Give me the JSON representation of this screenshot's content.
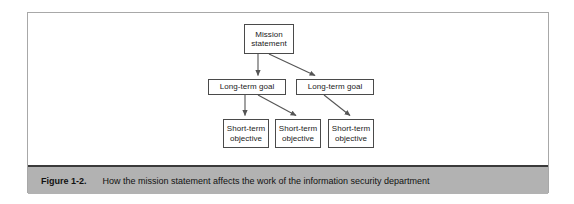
{
  "figure": {
    "caption_label": "Figure 1-2.",
    "caption_text": "How the mission statement affects the work of the information security department",
    "colors": {
      "caption_bar": "#b2b2b2",
      "caption_rule": "#3a3a3a",
      "frame_border": "#a8a8a8",
      "node_border": "#4a4a4a",
      "node_fill": "#ffffff",
      "connector": "#555555",
      "page_background": "#ffffff"
    }
  },
  "diagram": {
    "type": "hierarchy-tree",
    "nodes": [
      {
        "id": "mission",
        "line1": "Mission",
        "line2": "statement",
        "level": 1
      },
      {
        "id": "goal-1",
        "line1": "Long-term goal",
        "line2": "",
        "level": 2
      },
      {
        "id": "goal-2",
        "line1": "Long-term goal",
        "line2": "",
        "level": 2
      },
      {
        "id": "objective-1",
        "line1": "Short-term",
        "line2": "objective",
        "level": 3
      },
      {
        "id": "objective-2",
        "line1": "Short-term",
        "line2": "objective",
        "level": 3
      },
      {
        "id": "objective-3",
        "line1": "Short-term",
        "line2": "objective",
        "level": 3
      }
    ],
    "edges": [
      {
        "from": "mission",
        "to": "goal-1",
        "style": "arrow"
      },
      {
        "from": "mission",
        "to": "goal-2",
        "style": "arrow"
      },
      {
        "from": "goal-1",
        "to": "objective-1",
        "style": "arrow"
      },
      {
        "from": "goal-1",
        "to": "objective-2",
        "style": "arrow"
      },
      {
        "from": "goal-2",
        "to": "objective-3",
        "style": "arrow"
      }
    ]
  }
}
